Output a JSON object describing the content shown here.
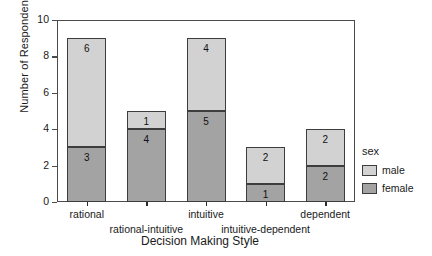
{
  "chart_data": {
    "type": "bar",
    "stacked": true,
    "title": "",
    "xlabel": "Decision Making Style",
    "ylabel": "Number of Respondents",
    "ylim": [
      0,
      10
    ],
    "yticks": [
      0,
      2,
      4,
      6,
      8,
      10
    ],
    "grid": false,
    "legend": {
      "title": "sex",
      "position": "right-outside",
      "entries": [
        {
          "name": "male",
          "color": "#d2d2d2"
        },
        {
          "name": "female",
          "color": "#a3a3a3"
        }
      ]
    },
    "categories": [
      "rational",
      "rational-intuitive",
      "intuitive",
      "intuitive-dependent",
      "dependent"
    ],
    "series": [
      {
        "name": "female",
        "color": "#a3a3a3",
        "values": [
          3,
          4,
          5,
          1,
          2
        ]
      },
      {
        "name": "male",
        "color": "#d2d2d2",
        "values": [
          6,
          1,
          4,
          2,
          2
        ]
      }
    ],
    "totals": [
      9,
      5,
      9,
      3,
      4
    ],
    "bar_labels": [
      {
        "category": "rational",
        "female": "3",
        "male": "6"
      },
      {
        "category": "rational-intuitive",
        "female": "4",
        "male": "1"
      },
      {
        "category": "intuitive",
        "female": "5",
        "male": "4"
      },
      {
        "category": "intuitive-dependent",
        "female": "1",
        "male": "2"
      },
      {
        "category": "dependent",
        "female": "2",
        "male": "2"
      }
    ],
    "tick_labels": {
      "y": [
        "0",
        "2",
        "4",
        "6",
        "8",
        "10"
      ],
      "x": [
        "rational",
        "rational-intuitive",
        "intuitive",
        "intuitive-dependent",
        "dependent"
      ]
    },
    "colors": {
      "male": "#d2d2d2",
      "female": "#a3a3a3",
      "axis": "#4b4b4b",
      "bar_outline": "#3d3d3d",
      "background": "#ffffff",
      "text": "#1a1a1a"
    }
  }
}
